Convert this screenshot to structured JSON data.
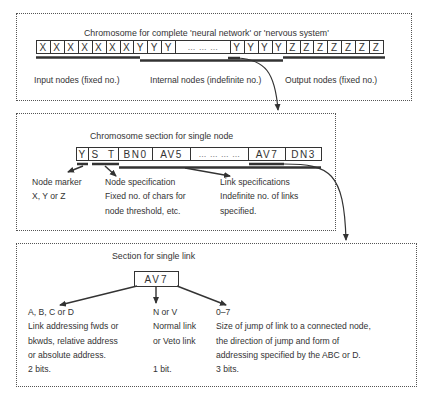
{
  "panel1": {
    "title": "Chromosome  for complete 'neural network' or 'nervous system'",
    "cells": [
      "X",
      "X",
      "X",
      "X",
      "X",
      "X",
      "X",
      "Y",
      "Y",
      "Y",
      "… … …",
      "Y",
      "Y",
      "Y",
      "Y",
      "Z",
      "Z",
      "Z",
      "Z",
      "Z",
      "Z",
      "Z"
    ],
    "labels": {
      "input": "Input nodes (fixed no.)",
      "internal": "Internal nodes (indefinite no.)",
      "output": "Output nodes (fixed no.)"
    }
  },
  "panel2": {
    "title": "Chromosome section for single node",
    "cells": [
      "Y",
      "S  T",
      "BN0",
      "AV5",
      "… … … …",
      "AV7",
      "DN3"
    ],
    "node_marker": {
      "line1": "Node marker",
      "line2": "X, Y or Z"
    },
    "node_spec": {
      "line1": "Node specification",
      "line2": "Fixed no. of chars for",
      "line3": "node threshold, etc."
    },
    "link_spec": {
      "line1": "Link specifications",
      "line2": "Indefinite no. of links",
      "line3": "specified."
    }
  },
  "panel3": {
    "title": "Section for single link",
    "link_code": "AV7",
    "col1": {
      "line1": "A, B, C or D",
      "line2": "Link addressing fwds or",
      "line3": "bkwds, relative address",
      "line4": "or absolute address.",
      "line5": "2 bits."
    },
    "col2": {
      "line1": "N or V",
      "line2": "Normal link",
      "line3": "or Veto link",
      "line5": "1 bit."
    },
    "col3": {
      "line1": "0–7",
      "line2": "Size of jump of link to a connected node,",
      "line3": "the direction of jump and form of",
      "line4": "addressing specified by the ABC or D.",
      "line5": "3 bits."
    }
  },
  "colors": {
    "ink": "#333333",
    "border": "#555555",
    "background": "#ffffff"
  }
}
